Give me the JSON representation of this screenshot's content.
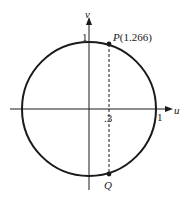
{
  "figure": {
    "axes": {
      "horizontal_label": "u",
      "vertical_label": "v"
    },
    "circle": {
      "radius_label_top": "1",
      "radius_label_right": "1"
    },
    "tick_label_x": ".3",
    "point_p": {
      "name": "P",
      "coords": "(1.266)"
    },
    "point_q": {
      "name": "Q"
    },
    "colors": {
      "stroke": "#1a1a1a",
      "background": "#ffffff"
    }
  }
}
